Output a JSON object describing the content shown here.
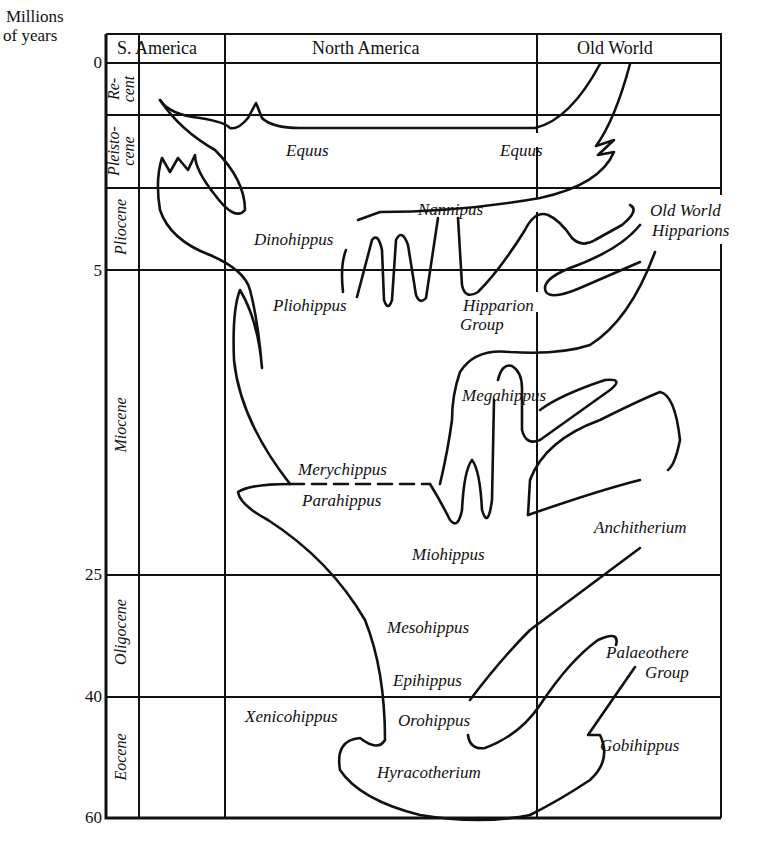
{
  "diagram": {
    "type": "phylogeny-chart",
    "axis": {
      "title_line1": "Millions",
      "title_line2": "of years",
      "ticks": [
        "0",
        "5",
        "25",
        "40",
        "60"
      ]
    },
    "columns": [
      "S. America",
      "North America",
      "Old World"
    ],
    "epochs": [
      {
        "line1": "Re-",
        "line2": "cent"
      },
      {
        "line1": "Pleisto-",
        "line2": "cene"
      },
      {
        "line1": "Pliocene",
        "line2": ""
      },
      {
        "line1": "Miocene",
        "line2": ""
      },
      {
        "line1": "Oligocene",
        "line2": ""
      },
      {
        "line1": "Eocene",
        "line2": ""
      }
    ],
    "taxa": {
      "equus_na": "Equus",
      "equus_ow": "Equus",
      "nannipus": "Nannipus",
      "dinohippus": "Dinohippus",
      "pliohippus": "Pliohippus",
      "hipparion_line1": "Hipparion",
      "hipparion_line2": "Group",
      "ow_hipparions_line1": "Old World",
      "ow_hipparions_line2": "Hipparions",
      "megahippus": "Megahippus",
      "merychippus": "Merychippus",
      "parahippus": "Parahippus",
      "miohippus": "Miohippus",
      "anchitherium": "Anchitherium",
      "mesohippus": "Mesohippus",
      "epihippus": "Epihippus",
      "palaeothere_line1": "Palaeothere",
      "palaeothere_line2": "Group",
      "xenicohippus": "Xenicohippus",
      "orohippus": "Orohippus",
      "gobihippus": "Gobihippus",
      "hyracotherium": "Hyracotherium"
    },
    "colors": {
      "ink": "#111111",
      "paper": "#ffffff"
    }
  }
}
